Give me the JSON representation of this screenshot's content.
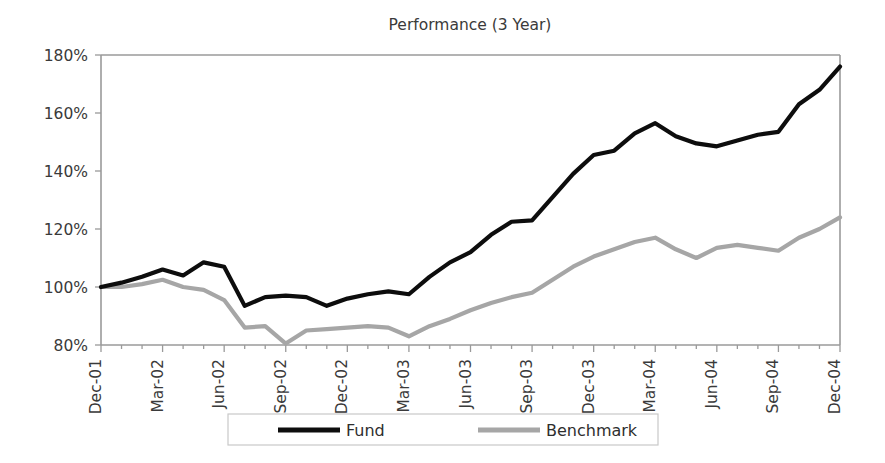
{
  "chart_data": {
    "type": "line",
    "title": "Performance (3 Year)",
    "xlabel": "",
    "ylabel": "",
    "ylim": [
      80,
      180
    ],
    "ytick_labels": [
      "80%",
      "100%",
      "120%",
      "140%",
      "160%",
      "180%"
    ],
    "ytick_values": [
      80,
      100,
      120,
      140,
      160,
      180
    ],
    "grid": false,
    "legend_position": "bottom",
    "x": [
      "Dec-01",
      "Jan-02",
      "Feb-02",
      "Mar-02",
      "Apr-02",
      "May-02",
      "Jun-02",
      "Jul-02",
      "Aug-02",
      "Sep-02",
      "Oct-02",
      "Nov-02",
      "Dec-02",
      "Jan-03",
      "Feb-03",
      "Mar-03",
      "Apr-03",
      "May-03",
      "Jun-03",
      "Jul-03",
      "Aug-03",
      "Sep-03",
      "Oct-03",
      "Nov-03",
      "Dec-03",
      "Jan-04",
      "Feb-04",
      "Mar-04",
      "Apr-04",
      "May-04",
      "Jun-04",
      "Jul-04",
      "Aug-04",
      "Sep-04",
      "Oct-04",
      "Nov-04",
      "Dec-04"
    ],
    "xtick_labels": [
      "Dec-01",
      "Mar-02",
      "Jun-02",
      "Sep-02",
      "Dec-02",
      "Mar-03",
      "Jun-03",
      "Sep-03",
      "Dec-03",
      "Mar-04",
      "Jun-04",
      "Sep-04",
      "Dec-04"
    ],
    "xtick_indices": [
      0,
      3,
      6,
      9,
      12,
      15,
      18,
      21,
      24,
      27,
      30,
      33,
      36
    ],
    "series": [
      {
        "name": "Fund",
        "color": "#0d0d0d",
        "values": [
          100.0,
          101.5,
          103.5,
          106.0,
          104.0,
          108.5,
          107.0,
          93.5,
          96.5,
          97.0,
          96.5,
          93.5,
          96.0,
          97.5,
          98.5,
          97.5,
          103.5,
          108.5,
          112.0,
          118.0,
          122.5,
          123.0,
          131.0,
          139.0,
          145.5,
          147.0,
          153.0,
          156.5,
          152.0,
          149.5,
          148.5,
          150.5,
          152.5,
          153.5,
          163.0,
          168.0,
          176.0
        ]
      },
      {
        "name": "Benchmark",
        "color": "#a6a6a6",
        "values": [
          100.0,
          100.0,
          101.0,
          102.5,
          100.0,
          99.0,
          95.5,
          86.0,
          86.5,
          80.5,
          85.0,
          85.5,
          86.0,
          86.5,
          86.0,
          83.0,
          86.5,
          89.0,
          92.0,
          94.5,
          96.5,
          98.0,
          102.5,
          107.0,
          110.5,
          113.0,
          115.5,
          117.0,
          113.0,
          110.0,
          113.5,
          114.5,
          113.5,
          112.5,
          117.0,
          120.0,
          124.0
        ]
      }
    ]
  },
  "legend": {
    "items": [
      {
        "label": "Fund",
        "color": "#0d0d0d"
      },
      {
        "label": "Benchmark",
        "color": "#a6a6a6"
      }
    ]
  }
}
